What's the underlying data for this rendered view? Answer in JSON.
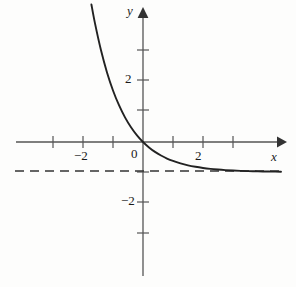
{
  "figure": {
    "background_color": "#fdfdfc",
    "ink_color": "#2a2a2a",
    "axis_color": "#555555",
    "curve_color": "#222222",
    "asymptote_color": "#333333"
  },
  "axes": {
    "x_axis_label": "x",
    "y_axis_label": "y",
    "origin_label": "0",
    "x_tick_labels": [
      "−2",
      "2"
    ],
    "y_tick_labels": [
      "2",
      "−2"
    ],
    "x_ticks_values": [
      -4,
      -3,
      -2,
      -1,
      1,
      2,
      3
    ],
    "y_ticks_values": [
      3,
      2,
      1,
      -1,
      -2,
      -3,
      -4
    ],
    "x_range": [
      -4.3,
      4.5
    ],
    "y_range": [
      -4.6,
      4.3
    ],
    "grid": "off",
    "x_axis_arrow": "right-arrow-icon",
    "y_axis_arrow": "up-arrow-icon"
  },
  "chart_data": {
    "type": "line",
    "title": "",
    "xlabel": "x",
    "ylabel": "y",
    "xlim": [
      -4.3,
      4.5
    ],
    "ylim": [
      -4.6,
      4.3
    ],
    "grid": false,
    "legend": "none",
    "series": [
      {
        "name": "y = e^(-x) - 1",
        "style": "solid",
        "x": [
          -1.72,
          -1.6,
          -1.4,
          -1.2,
          -1.0,
          -0.8,
          -0.6,
          -0.4,
          -0.2,
          0.0,
          0.2,
          0.4,
          0.6,
          0.8,
          1.0,
          1.25,
          1.5,
          1.75,
          2.0,
          2.25,
          2.5,
          2.75,
          3.0,
          3.25,
          3.5,
          3.75,
          4.0,
          4.3,
          4.6
        ],
        "y": [
          4.585,
          3.953,
          3.055,
          2.32,
          1.718,
          1.226,
          0.822,
          0.492,
          0.221,
          0.0,
          -0.181,
          -0.33,
          -0.451,
          -0.551,
          -0.632,
          -0.713,
          -0.777,
          -0.826,
          -0.865,
          -0.895,
          -0.918,
          -0.936,
          -0.95,
          -0.961,
          -0.97,
          -0.976,
          -0.982,
          -0.986,
          -0.99
        ]
      },
      {
        "name": "horizontal asymptote y = -1",
        "style": "dashed",
        "x": [
          -4.25,
          4.65
        ],
        "y": [
          -1,
          -1
        ]
      }
    ],
    "annotations": [
      {
        "text": "0",
        "x": -0.28,
        "y": -0.42,
        "role": "origin-label"
      },
      {
        "text": "−2",
        "x": -2.1,
        "y": -0.5,
        "role": "x-tick-label"
      },
      {
        "text": "2",
        "x": 1.85,
        "y": -0.5,
        "role": "x-tick-label"
      },
      {
        "text": "2",
        "x": -0.52,
        "y": 2.0,
        "role": "y-tick-label"
      },
      {
        "text": "−2",
        "x": -0.68,
        "y": -2.0,
        "role": "y-tick-label"
      },
      {
        "text": "y",
        "x": -0.5,
        "y": 4.35,
        "role": "axis-name"
      },
      {
        "text": "x",
        "x": 4.3,
        "y": -0.48,
        "role": "axis-name"
      }
    ]
  }
}
